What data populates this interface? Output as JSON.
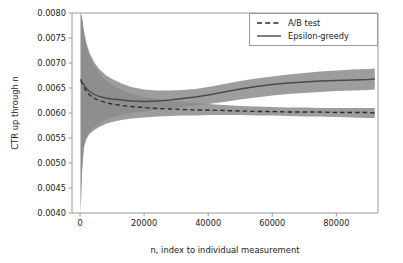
{
  "chart_data": {
    "type": "line",
    "title": "",
    "xlabel": "n, index to individual measurement",
    "ylabel": "CTR up through n",
    "xlim": [
      -2500,
      93000
    ],
    "ylim": [
      0.004,
      0.008
    ],
    "xticks": [
      0,
      20000,
      40000,
      60000,
      80000
    ],
    "xticklabels": [
      "0",
      "20000",
      "40000",
      "60000",
      "80000"
    ],
    "yticks": [
      0.004,
      0.0045,
      0.005,
      0.0055,
      0.006,
      0.0065,
      0.007,
      0.0075,
      0.008
    ],
    "yticklabels": [
      "0.0040",
      "0.0045",
      "0.0050",
      "0.0055",
      "0.0060",
      "0.0065",
      "0.0070",
      "0.0075",
      "0.0080"
    ],
    "grid": false,
    "legend_position": "upper right",
    "band_color": "#8c8c8c",
    "band_opacity": 0.85,
    "series": [
      {
        "name": "A/B test",
        "style": "dashed",
        "color": "#2b2b2b",
        "x": [
          200,
          600,
          1200,
          2000,
          3000,
          4500,
          6000,
          8000,
          10000,
          13000,
          16000,
          20000,
          24000,
          28000,
          32000,
          36000,
          40000,
          45000,
          50000,
          55000,
          60000,
          65000,
          70000,
          75000,
          80000,
          85000,
          90000,
          92000
        ],
        "values": [
          0.00665,
          0.0066,
          0.00652,
          0.00643,
          0.00636,
          0.00629,
          0.00625,
          0.00621,
          0.00618,
          0.00615,
          0.00613,
          0.00611,
          0.00609,
          0.00608,
          0.00607,
          0.00606,
          0.00606,
          0.00605,
          0.00604,
          0.00603,
          0.00603,
          0.00602,
          0.00602,
          0.00602,
          0.00601,
          0.00601,
          0.00601,
          0.006
        ],
        "lower": [
          0.004,
          0.0048,
          0.0053,
          0.00548,
          0.00558,
          0.00566,
          0.00572,
          0.00578,
          0.00582,
          0.00586,
          0.00589,
          0.00591,
          0.00593,
          0.00594,
          0.00595,
          0.00595,
          0.00596,
          0.00596,
          0.00596,
          0.00595,
          0.00595,
          0.00594,
          0.00593,
          0.00593,
          0.00592,
          0.00591,
          0.0059,
          0.0059
        ],
        "upper": [
          0.008,
          0.0079,
          0.0076,
          0.00735,
          0.00714,
          0.00694,
          0.0068,
          0.00666,
          0.00656,
          0.00646,
          0.00639,
          0.00632,
          0.00628,
          0.00624,
          0.00622,
          0.0062,
          0.00618,
          0.00616,
          0.00614,
          0.00613,
          0.00612,
          0.00611,
          0.00611,
          0.0061,
          0.0061,
          0.0061,
          0.0061,
          0.0061
        ]
      },
      {
        "name": "Epsilon-greedy",
        "style": "solid",
        "color": "#4a4a4a",
        "x": [
          200,
          600,
          1200,
          2000,
          3000,
          4500,
          6000,
          8000,
          10000,
          13000,
          16000,
          20000,
          24000,
          28000,
          32000,
          36000,
          40000,
          45000,
          50000,
          55000,
          60000,
          65000,
          70000,
          75000,
          80000,
          85000,
          90000,
          92000
        ],
        "values": [
          0.00668,
          0.00663,
          0.00657,
          0.00649,
          0.00643,
          0.00637,
          0.00633,
          0.0063,
          0.00628,
          0.00626,
          0.00624,
          0.00623,
          0.00624,
          0.00626,
          0.00629,
          0.00632,
          0.00636,
          0.00642,
          0.00648,
          0.00653,
          0.00657,
          0.0066,
          0.00662,
          0.00664,
          0.00665,
          0.00666,
          0.00667,
          0.00668
        ],
        "lower": [
          0.00402,
          0.00485,
          0.00535,
          0.00553,
          0.00563,
          0.00572,
          0.00579,
          0.00586,
          0.00591,
          0.00596,
          0.006,
          0.00603,
          0.00606,
          0.00609,
          0.00612,
          0.00615,
          0.00618,
          0.00622,
          0.00627,
          0.00631,
          0.00635,
          0.00638,
          0.0064,
          0.00642,
          0.00644,
          0.00645,
          0.00646,
          0.00647
        ],
        "upper": [
          0.008,
          0.00792,
          0.00765,
          0.0074,
          0.0072,
          0.00701,
          0.00688,
          0.00676,
          0.00668,
          0.00659,
          0.00652,
          0.00647,
          0.00645,
          0.00645,
          0.00646,
          0.00648,
          0.00652,
          0.00658,
          0.00664,
          0.00669,
          0.00673,
          0.00677,
          0.0068,
          0.00683,
          0.00685,
          0.00687,
          0.00688,
          0.00689
        ]
      }
    ]
  },
  "legend": {
    "entries": [
      {
        "label": "A/B test",
        "style": "dashed"
      },
      {
        "label": "Epsilon-greedy",
        "style": "solid"
      }
    ]
  }
}
